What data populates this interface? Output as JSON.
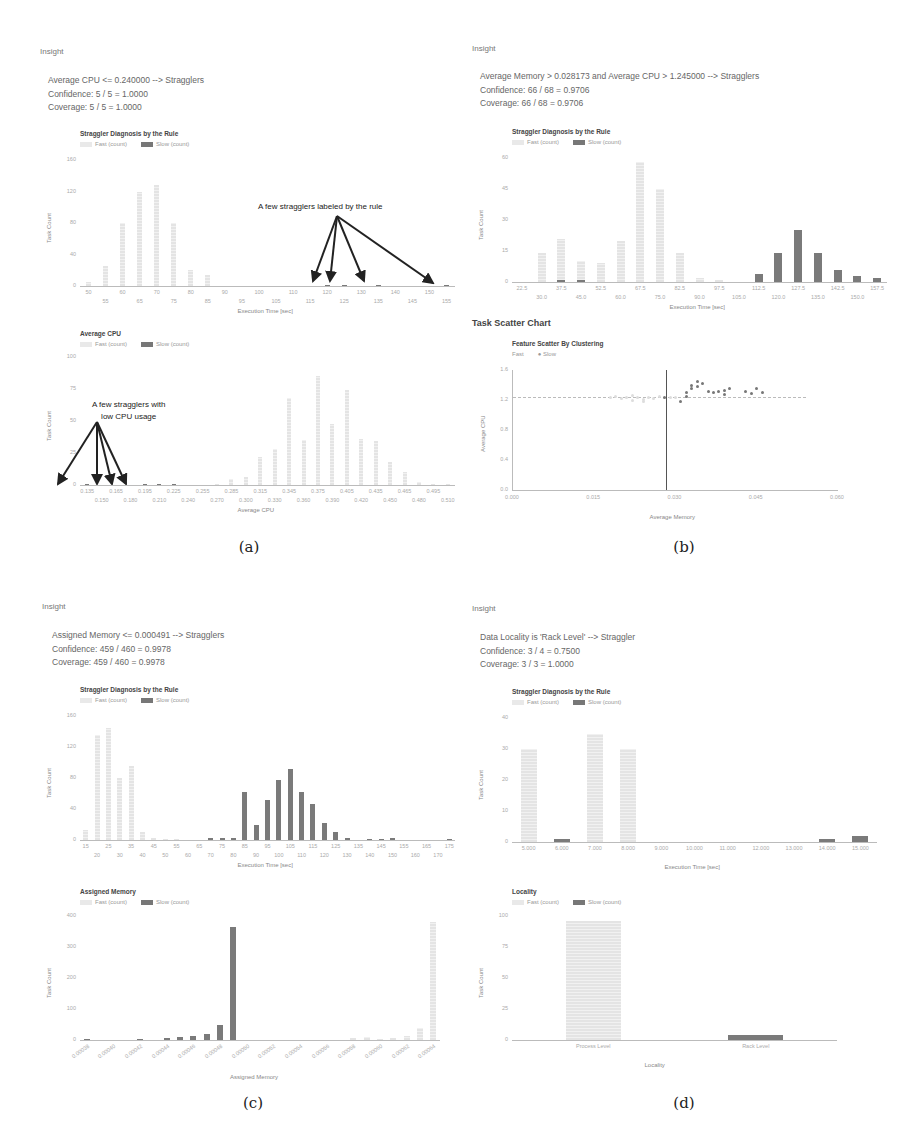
{
  "panels": {
    "a": {
      "insight_label": "Insight",
      "rule": "Average CPU <= 0.240000 --> Stragglers",
      "confidence": "Confidence: 5 / 5 = 1.0000",
      "coverage": "Coverage: 5 / 5 = 1.0000",
      "caption": "(a)",
      "annotation_top": "A few stragglers labeled by the rule",
      "annotation_bottom_1": "A few stragglers with",
      "annotation_bottom_2": "low CPU usage"
    },
    "b": {
      "insight_label": "Insight",
      "rule": "Average Memory > 0.028173 and Average CPU > 1.245000 --> Stragglers",
      "confidence": "Confidence: 66 / 68 = 0.9706",
      "coverage": "Coverage: 66 / 68 = 0.9706",
      "scatter_section_title": "Task Scatter Chart",
      "caption": "(b)"
    },
    "c": {
      "insight_label": "Insight",
      "rule": "Assigned Memory <= 0.000491 --> Stragglers",
      "confidence": "Confidence: 459 / 460 = 0.9978",
      "coverage": "Coverage: 459 / 460 = 0.9978",
      "caption": "(c)"
    },
    "d": {
      "insight_label": "Insight",
      "rule": "Data Locality is 'Rack Level' --> Straggler",
      "confidence": "Confidence: 3 / 4 = 0.7500",
      "coverage": "Coverage: 3 / 3 = 1.0000",
      "caption": "(d)"
    }
  },
  "legend": {
    "fast": "Fast (count)",
    "slow": "Slow (count)",
    "scatter_fast": "Fast",
    "scatter_slow": "Slow"
  },
  "colors": {
    "fast": "#e6e6e6",
    "slow": "#7a7a7a",
    "annotation": "#222222"
  },
  "chart_data": [
    {
      "id": "a1",
      "type": "bar",
      "title": "Straggler Diagnosis by the Rule",
      "xlabel": "Execution Time [sec]",
      "ylabel": "Task Count",
      "ylim": [
        0,
        160
      ],
      "yticks": [
        0,
        40,
        80,
        120,
        160
      ],
      "xtick_labels_top": [
        "50",
        "60",
        "70",
        "80",
        "90",
        "100",
        "110",
        "120",
        "130",
        "140",
        "150"
      ],
      "xtick_labels_bottom": [
        "55",
        "65",
        "75",
        "85",
        "95",
        "105",
        "115",
        "125",
        "135",
        "155"
      ],
      "categories": [
        "50",
        "55",
        "60",
        "65",
        "70",
        "75",
        "80",
        "85",
        "90",
        "95",
        "100",
        "105",
        "110",
        "115",
        "120",
        "125",
        "130",
        "135",
        "140",
        "145",
        "150",
        "155"
      ],
      "series": [
        {
          "name": "Fast (count)",
          "values": [
            5,
            25,
            80,
            120,
            128,
            80,
            20,
            14,
            0,
            0,
            0,
            0,
            0,
            0,
            0,
            0,
            0,
            0,
            0,
            0,
            0,
            0
          ]
        },
        {
          "name": "Slow (count)",
          "values": [
            0,
            0,
            0,
            0,
            0,
            0,
            0,
            0,
            0,
            0,
            0,
            0,
            0,
            0,
            1,
            1,
            0,
            1,
            0,
            0,
            0,
            1
          ]
        }
      ],
      "annotation": "A few stragglers labeled by the rule",
      "legend_position": "top-left",
      "grid": false
    },
    {
      "id": "a2",
      "type": "bar",
      "title": "Average CPU",
      "xlabel": "Average CPU",
      "ylabel": "Task Count",
      "ylim": [
        0,
        100
      ],
      "yticks": [
        0,
        25,
        50,
        75,
        100
      ],
      "categories": [
        "0.135",
        "0.150",
        "0.165",
        "0.180",
        "0.195",
        "0.210",
        "0.225",
        "0.240",
        "0.255",
        "0.270",
        "0.285",
        "0.300",
        "0.315",
        "0.330",
        "0.345",
        "0.360",
        "0.375",
        "0.390",
        "0.405",
        "0.420",
        "0.435",
        "0.450",
        "0.465",
        "0.480",
        "0.495",
        "0.510"
      ],
      "series": [
        {
          "name": "Fast (count)",
          "values": [
            0,
            0,
            0,
            0,
            0,
            0,
            0,
            0,
            0,
            1,
            5,
            6,
            22,
            28,
            68,
            35,
            85,
            48,
            74,
            36,
            34,
            18,
            10,
            2,
            1,
            1
          ]
        },
        {
          "name": "Slow (count)",
          "values": [
            1,
            0,
            0,
            0,
            1,
            1,
            1,
            0,
            0,
            0,
            0,
            0,
            0,
            0,
            0,
            0,
            0,
            0,
            0,
            0,
            0,
            0,
            0,
            0,
            0,
            0
          ]
        }
      ],
      "annotation": "A few stragglers with low CPU usage",
      "legend_position": "top-left",
      "grid": false
    },
    {
      "id": "b1",
      "type": "bar",
      "title": "Straggler Diagnosis by the Rule",
      "xlabel": "Execution Time [sec]",
      "ylabel": "Task Count",
      "ylim": [
        0,
        60
      ],
      "yticks": [
        0,
        15,
        30,
        45,
        60
      ],
      "categories": [
        "22.5",
        "30.0",
        "37.5",
        "45.0",
        "52.5",
        "60.0",
        "67.5",
        "75.0",
        "82.5",
        "90.0",
        "97.5",
        "105.0",
        "112.5",
        "120.0",
        "127.5",
        "135.0",
        "142.5",
        "150.0",
        "157.5"
      ],
      "series": [
        {
          "name": "Fast (count)",
          "values": [
            0,
            14,
            21,
            10,
            9,
            20,
            58,
            45,
            14,
            2,
            1,
            0,
            0,
            0,
            0,
            0,
            0,
            0,
            0
          ]
        },
        {
          "name": "Slow (count)",
          "values": [
            0,
            0,
            1,
            1,
            0,
            0,
            0,
            0,
            0,
            0,
            0,
            0,
            4,
            14,
            25,
            14,
            6,
            3,
            2
          ]
        }
      ],
      "legend_position": "top-left",
      "grid": false
    },
    {
      "id": "b2",
      "type": "scatter",
      "title": "Feature Scatter By Clustering",
      "xlabel": "Average Memory",
      "ylabel": "Average CPU",
      "xlim": [
        0.0,
        0.06
      ],
      "ylim": [
        0.0,
        1.6
      ],
      "xticks": [
        "0.000",
        "0.015",
        "0.030",
        "0.045",
        "0.060"
      ],
      "yticks": [
        "0.0",
        "0.4",
        "0.8",
        "1.2",
        "1.6"
      ],
      "reference_lines": {
        "x": 0.028173,
        "y": 1.245
      },
      "series": [
        {
          "name": "Fast",
          "points": [
            [
              0.018,
              1.24
            ],
            [
              0.019,
              1.25
            ],
            [
              0.02,
              1.22
            ],
            [
              0.021,
              1.23
            ],
            [
              0.022,
              1.26
            ],
            [
              0.022,
              1.2
            ],
            [
              0.023,
              1.24
            ],
            [
              0.024,
              1.21
            ],
            [
              0.024,
              1.18
            ],
            [
              0.025,
              1.23
            ],
            [
              0.026,
              1.22
            ],
            [
              0.027,
              1.25
            ],
            [
              0.029,
              1.23
            ],
            [
              0.03,
              1.24
            ]
          ]
        },
        {
          "name": "Slow",
          "points": [
            [
              0.028,
              1.24
            ],
            [
              0.032,
              1.25
            ],
            [
              0.032,
              1.3
            ],
            [
              0.033,
              1.35
            ],
            [
              0.033,
              1.4
            ],
            [
              0.034,
              1.45
            ],
            [
              0.034,
              1.38
            ],
            [
              0.035,
              1.42
            ],
            [
              0.036,
              1.32
            ],
            [
              0.037,
              1.3
            ],
            [
              0.038,
              1.31
            ],
            [
              0.039,
              1.28
            ],
            [
              0.039,
              1.33
            ],
            [
              0.04,
              1.36
            ],
            [
              0.043,
              1.32
            ],
            [
              0.044,
              1.29
            ],
            [
              0.045,
              1.35
            ],
            [
              0.046,
              1.3
            ],
            [
              0.031,
              1.18
            ]
          ]
        }
      ],
      "legend_position": "top-left",
      "grid": false
    },
    {
      "id": "c1",
      "type": "bar",
      "title": "Straggler Diagnosis by the Rule",
      "xlabel": "Execution Time [sec]",
      "ylabel": "Task Count",
      "ylim": [
        0,
        160
      ],
      "yticks": [
        0,
        40,
        80,
        120,
        160
      ],
      "categories": [
        "15",
        "20",
        "25",
        "30",
        "35",
        "40",
        "45",
        "50",
        "55",
        "60",
        "65",
        "70",
        "75",
        "80",
        "85",
        "90",
        "95",
        "100",
        "105",
        "110",
        "115",
        "120",
        "125",
        "130",
        "135",
        "140",
        "145",
        "150",
        "155",
        "160",
        "165",
        "170",
        "175"
      ],
      "series": [
        {
          "name": "Fast (count)",
          "values": [
            13,
            135,
            145,
            80,
            95,
            10,
            2,
            1,
            1,
            0,
            0,
            0,
            0,
            0,
            0,
            0,
            0,
            0,
            0,
            0,
            0,
            0,
            0,
            0,
            0,
            0,
            0,
            0,
            0,
            0,
            0,
            0,
            1
          ]
        },
        {
          "name": "Slow (count)",
          "values": [
            0,
            0,
            0,
            0,
            0,
            0,
            0,
            0,
            0,
            0,
            0,
            2,
            3,
            2,
            62,
            20,
            52,
            78,
            92,
            62,
            46,
            22,
            10,
            3,
            0,
            1,
            1,
            2,
            0,
            0,
            0,
            0,
            1
          ]
        }
      ],
      "legend_position": "top-left",
      "grid": false
    },
    {
      "id": "c2",
      "type": "bar",
      "title": "Assigned Memory",
      "xlabel": "Assigned Memory",
      "ylabel": "Task Count",
      "ylim": [
        0,
        400
      ],
      "yticks": [
        0,
        100,
        200,
        300,
        400
      ],
      "categories": [
        "0.00038",
        "0.00040",
        "0.00042",
        "0.00044",
        "0.00046",
        "0.00048",
        "0.00050",
        "0.00052",
        "0.00054",
        "0.00056",
        "0.00058",
        "0.00060",
        "0.00062",
        "0.00064"
      ],
      "bins": [
        "0.00038",
        "0.00039",
        "0.00040",
        "0.00041",
        "0.00042",
        "0.00043",
        "0.00044",
        "0.00045",
        "0.00046",
        "0.00047",
        "0.00048",
        "0.00049",
        "0.00050",
        "0.00051",
        "0.00052",
        "0.00053",
        "0.00054",
        "0.00055",
        "0.00056",
        "0.00057",
        "0.00058",
        "0.00059",
        "0.00060",
        "0.00061",
        "0.00062",
        "0.00063",
        "0.00064"
      ],
      "series": [
        {
          "name": "Fast (count)",
          "values": [
            0,
            0,
            0,
            0,
            0,
            0,
            0,
            0,
            0,
            0,
            0,
            0,
            0,
            0,
            0,
            0,
            0,
            0,
            0,
            0,
            5,
            10,
            4,
            6,
            14,
            40,
            380
          ]
        },
        {
          "name": "Slow (count)",
          "values": [
            2,
            0,
            0,
            0,
            2,
            0,
            6,
            10,
            12,
            18,
            48,
            365,
            0,
            0,
            0,
            0,
            0,
            0,
            0,
            0,
            0,
            0,
            0,
            0,
            0,
            0,
            0
          ]
        }
      ],
      "legend_position": "top-left",
      "grid": false
    },
    {
      "id": "d1",
      "type": "bar",
      "title": "Straggler Diagnosis by the Rule",
      "xlabel": "Execution Time [sec]",
      "ylabel": "Task Count",
      "ylim": [
        0,
        40
      ],
      "yticks": [
        0,
        10,
        20,
        30,
        40
      ],
      "categories": [
        "5.000",
        "6.000",
        "7.000",
        "8.000",
        "9.000",
        "10.000",
        "11.000",
        "12.000",
        "13.000",
        "14.000",
        "15.000"
      ],
      "series": [
        {
          "name": "Fast (count)",
          "values": [
            30,
            0,
            35,
            30,
            0,
            0,
            0,
            0,
            0,
            0,
            0
          ]
        },
        {
          "name": "Slow (count)",
          "values": [
            0,
            1,
            0,
            0,
            0,
            0,
            0,
            0,
            0,
            1,
            2
          ]
        }
      ],
      "legend_position": "top-left",
      "grid": false
    },
    {
      "id": "d2",
      "type": "bar",
      "title": "Locality",
      "xlabel": "Locality",
      "ylabel": "Task Count",
      "ylim": [
        0,
        100
      ],
      "yticks": [
        0,
        25,
        50,
        75,
        100
      ],
      "categories": [
        "Process Level",
        "Rack Level"
      ],
      "series": [
        {
          "name": "Fast (count)",
          "values": [
            96,
            1
          ]
        },
        {
          "name": "Slow (count)",
          "values": [
            0,
            4
          ]
        }
      ],
      "legend_position": "top-left",
      "grid": false
    }
  ]
}
